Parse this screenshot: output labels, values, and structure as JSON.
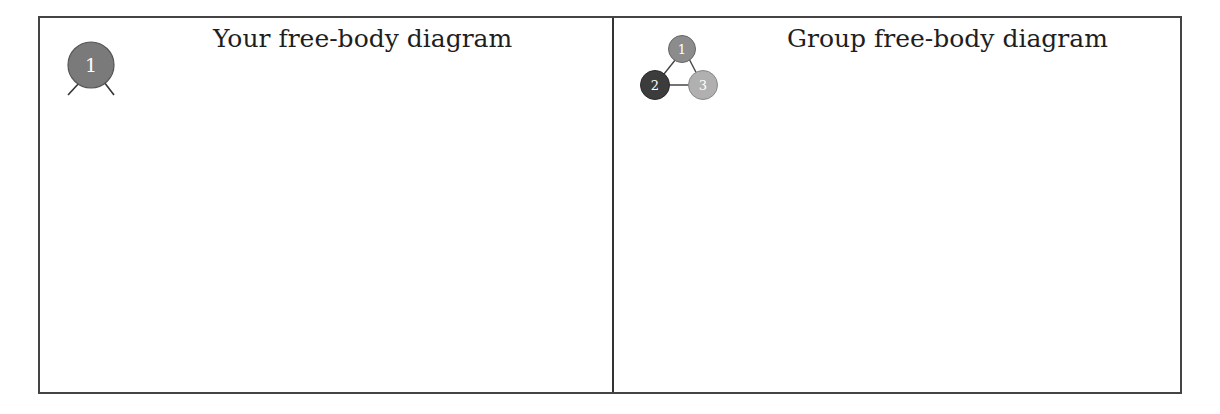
{
  "panels": [
    {
      "title": "Your free-body diagram",
      "icon": {
        "name": "single-person-icon",
        "nodes": [
          {
            "label": "1",
            "color": "#7a7a7a"
          }
        ]
      }
    },
    {
      "title": "Group free-body diagram",
      "icon": {
        "name": "group-triangle-icon",
        "nodes": [
          {
            "label": "1",
            "color": "#8c8c8c"
          },
          {
            "label": "2",
            "color": "#3c3c3c"
          },
          {
            "label": "3",
            "color": "#b0b0b0"
          }
        ]
      }
    }
  ],
  "colors": {
    "border": "#444444",
    "text": "#1e1e1e",
    "node_text": "#ffffff"
  }
}
